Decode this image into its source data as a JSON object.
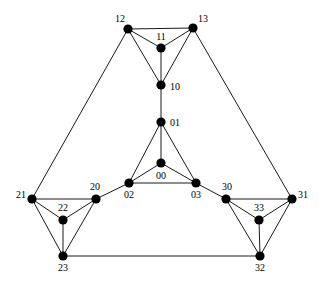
{
  "figure": {
    "name": "graph-diagram",
    "background_color": "#ffffff",
    "node_color": "#000000",
    "edge_color": "#1a1a1a",
    "node_radius": 4.6,
    "edge_width": 1
  },
  "nodes": [
    {
      "id": "00",
      "label": "00",
      "x": 161,
      "y": 163,
      "label_x": 161,
      "label_y": 177,
      "label_anchor": "middle"
    },
    {
      "id": "01",
      "label": "01",
      "x": 161,
      "y": 122,
      "label_x": 170,
      "label_y": 124,
      "label_anchor": "start"
    },
    {
      "id": "02",
      "label": "02",
      "x": 129,
      "y": 183,
      "label_x": 129,
      "label_y": 196,
      "label_anchor": "middle"
    },
    {
      "id": "03",
      "label": "03",
      "x": 196,
      "y": 183,
      "label_x": 196,
      "label_y": 196,
      "label_anchor": "middle"
    },
    {
      "id": "10",
      "label": "10",
      "x": 161,
      "y": 85,
      "label_x": 170,
      "label_y": 88,
      "label_anchor": "start"
    },
    {
      "id": "11",
      "label": "11",
      "x": 161,
      "y": 48,
      "label_x": 161,
      "label_y": 38,
      "label_anchor": "middle"
    },
    {
      "id": "12",
      "label": "12",
      "x": 128,
      "y": 29,
      "label_x": 120,
      "label_y": 20,
      "label_anchor": "middle"
    },
    {
      "id": "13",
      "label": "13",
      "x": 193,
      "y": 28,
      "label_x": 203,
      "label_y": 20,
      "label_anchor": "middle"
    },
    {
      "id": "20",
      "label": "20",
      "x": 96,
      "y": 199,
      "label_x": 95,
      "label_y": 188,
      "label_anchor": "middle"
    },
    {
      "id": "21",
      "label": "21",
      "x": 32,
      "y": 199,
      "label_x": 21,
      "label_y": 196,
      "label_anchor": "middle"
    },
    {
      "id": "22",
      "label": "22",
      "x": 63,
      "y": 220,
      "label_x": 63,
      "label_y": 209,
      "label_anchor": "middle"
    },
    {
      "id": "23",
      "label": "23",
      "x": 63,
      "y": 256,
      "label_x": 63,
      "label_y": 269,
      "label_anchor": "middle"
    },
    {
      "id": "30",
      "label": "30",
      "x": 226,
      "y": 199,
      "label_x": 227,
      "label_y": 188,
      "label_anchor": "middle"
    },
    {
      "id": "31",
      "label": "31",
      "x": 292,
      "y": 199,
      "label_x": 303,
      "label_y": 196,
      "label_anchor": "middle"
    },
    {
      "id": "32",
      "label": "32",
      "x": 260,
      "y": 256,
      "label_x": 260,
      "label_y": 269,
      "label_anchor": "middle"
    },
    {
      "id": "33",
      "label": "33",
      "x": 259,
      "y": 220,
      "label_x": 259,
      "label_y": 209,
      "label_anchor": "middle"
    }
  ],
  "edges": [
    {
      "from": "00",
      "to": "01"
    },
    {
      "from": "00",
      "to": "02"
    },
    {
      "from": "00",
      "to": "03"
    },
    {
      "from": "01",
      "to": "02"
    },
    {
      "from": "01",
      "to": "03"
    },
    {
      "from": "02",
      "to": "03"
    },
    {
      "from": "10",
      "to": "11"
    },
    {
      "from": "10",
      "to": "12"
    },
    {
      "from": "10",
      "to": "13"
    },
    {
      "from": "11",
      "to": "12"
    },
    {
      "from": "11",
      "to": "13"
    },
    {
      "from": "12",
      "to": "13"
    },
    {
      "from": "20",
      "to": "21"
    },
    {
      "from": "20",
      "to": "22"
    },
    {
      "from": "20",
      "to": "23"
    },
    {
      "from": "21",
      "to": "22"
    },
    {
      "from": "21",
      "to": "23"
    },
    {
      "from": "22",
      "to": "23"
    },
    {
      "from": "30",
      "to": "31"
    },
    {
      "from": "30",
      "to": "32"
    },
    {
      "from": "30",
      "to": "33"
    },
    {
      "from": "31",
      "to": "32"
    },
    {
      "from": "31",
      "to": "33"
    },
    {
      "from": "32",
      "to": "33"
    },
    {
      "from": "01",
      "to": "10"
    },
    {
      "from": "02",
      "to": "20"
    },
    {
      "from": "03",
      "to": "30"
    },
    {
      "from": "12",
      "to": "21"
    },
    {
      "from": "13",
      "to": "31"
    },
    {
      "from": "23",
      "to": "32"
    }
  ]
}
